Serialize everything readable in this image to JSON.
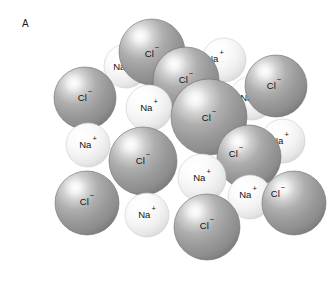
{
  "figure": {
    "panel_label": "A",
    "background_color": "#ffffff"
  },
  "legend_species": [
    {
      "id": "chloride",
      "symbol": "Cl",
      "charge": "−",
      "color": "#9b9b9b",
      "radius": 31
    },
    {
      "id": "sodium",
      "symbol": "Na",
      "charge": "+",
      "color": "#f1f1f1",
      "radius": 22
    }
  ],
  "ions": [
    {
      "id": "na-top-left",
      "species": "sodium",
      "cx": 126,
      "cy": 66,
      "r": 22,
      "label": "Na",
      "charge": "+",
      "label_dx": -4,
      "label_dy": 4,
      "clipped": true
    },
    {
      "id": "cl-top-center",
      "species": "chloride",
      "cx": 152,
      "cy": 52,
      "r": 33,
      "label": "Cl",
      "charge": "−",
      "label_dx": 0,
      "label_dy": 5,
      "clipped": true
    },
    {
      "id": "na-top-right",
      "species": "sodium",
      "cx": 224,
      "cy": 60,
      "r": 22,
      "label": "Na",
      "charge": "+",
      "label_dx": -9,
      "label_dy": 2,
      "clipped": true
    },
    {
      "id": "cl-upper-left",
      "species": "chloride",
      "cx": 85,
      "cy": 98,
      "r": 31,
      "label": "Cl",
      "charge": "−",
      "label_dx": 0,
      "label_dy": 3,
      "clipped": false
    },
    {
      "id": "cl-upper-mid",
      "species": "chloride",
      "cx": 186,
      "cy": 80,
      "r": 33,
      "label": "Cl",
      "charge": "−",
      "label_dx": 0,
      "label_dy": 3,
      "clipped": false
    },
    {
      "id": "na-right-upper",
      "species": "sodium",
      "cx": 252,
      "cy": 98,
      "r": 22,
      "label": "Na",
      "charge": "+",
      "label_dx": -3,
      "label_dy": 3,
      "clipped": true
    },
    {
      "id": "cl-top-far-right",
      "species": "chloride",
      "cx": 276,
      "cy": 86,
      "r": 31,
      "label": "Cl",
      "charge": "−",
      "label_dx": -2,
      "label_dy": 3,
      "clipped": false
    },
    {
      "id": "na-center-left",
      "species": "sodium",
      "cx": 149,
      "cy": 108,
      "r": 23,
      "label": "Na",
      "charge": "+",
      "label_dx": 0,
      "label_dy": 3,
      "clipped": false
    },
    {
      "id": "cl-center",
      "species": "chloride",
      "cx": 209,
      "cy": 117,
      "r": 38,
      "label": "Cl",
      "charge": "−",
      "label_dx": 0,
      "label_dy": 4,
      "clipped": false
    },
    {
      "id": "na-left-mid",
      "species": "sodium",
      "cx": 88,
      "cy": 145,
      "r": 22,
      "label": "Na",
      "charge": "+",
      "label_dx": 0,
      "label_dy": 3,
      "clipped": false
    },
    {
      "id": "na-right-mid",
      "species": "sodium",
      "cx": 283,
      "cy": 141,
      "r": 22,
      "label": "Na",
      "charge": "+",
      "label_dx": -3,
      "label_dy": 3,
      "clipped": true
    },
    {
      "id": "cl-mid-left",
      "species": "chloride",
      "cx": 143,
      "cy": 161,
      "r": 34,
      "label": "Cl",
      "charge": "−",
      "label_dx": 0,
      "label_dy": 3,
      "clipped": false
    },
    {
      "id": "cl-mid-right",
      "species": "chloride",
      "cx": 249,
      "cy": 157,
      "r": 32,
      "label": "Cl",
      "charge": "−",
      "label_dx": -13,
      "label_dy": 0,
      "clipped": false
    },
    {
      "id": "cl-lower-left",
      "species": "chloride",
      "cx": 87,
      "cy": 203,
      "r": 32,
      "label": "Cl",
      "charge": "−",
      "label_dx": 0,
      "label_dy": 2,
      "clipped": false
    },
    {
      "id": "na-center-low",
      "species": "sodium",
      "cx": 202,
      "cy": 178,
      "r": 24,
      "label": "Na",
      "charge": "+",
      "label_dx": 0,
      "label_dy": 3,
      "clipped": false
    },
    {
      "id": "na-bottom-left",
      "species": "sodium",
      "cx": 147,
      "cy": 215,
      "r": 22,
      "label": "Na",
      "charge": "+",
      "label_dx": 0,
      "label_dy": 3,
      "clipped": false
    },
    {
      "id": "na-bottom-right",
      "species": "sodium",
      "cx": 250,
      "cy": 197,
      "r": 22,
      "label": "Na",
      "charge": "+",
      "label_dx": -2,
      "label_dy": 1,
      "clipped": false
    },
    {
      "id": "cl-bottom-right",
      "species": "chloride",
      "cx": 294,
      "cy": 203,
      "r": 32,
      "label": "Cl",
      "charge": "−",
      "label_dx": -16,
      "label_dy": -6,
      "clipped": true
    },
    {
      "id": "cl-bottom-center",
      "species": "chloride",
      "cx": 207,
      "cy": 227,
      "r": 33,
      "label": "Cl",
      "charge": "−",
      "label_dx": 0,
      "label_dy": 2,
      "clipped": false
    }
  ]
}
